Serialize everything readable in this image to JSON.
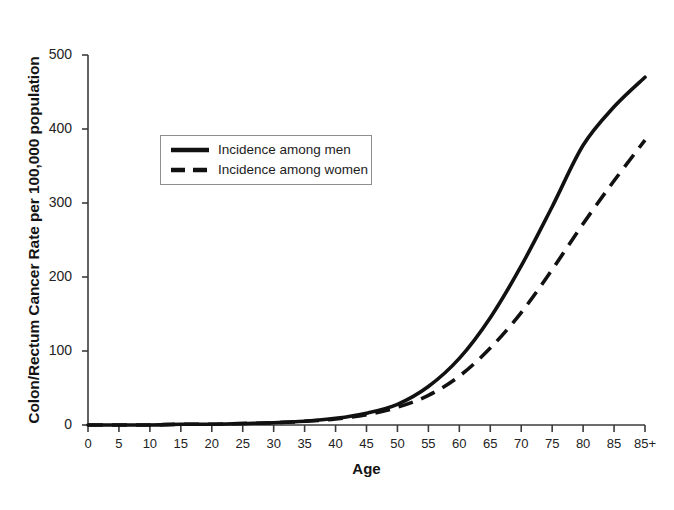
{
  "chart_data": {
    "type": "line",
    "title": "",
    "xlabel": "Age",
    "ylabel": "Colon/Rectum Cancer Rate per 100,000 population",
    "xlim": [
      0,
      90
    ],
    "ylim": [
      0,
      500
    ],
    "grid": false,
    "legend_position": "upper-left-inside",
    "x": [
      0,
      5,
      10,
      15,
      20,
      25,
      30,
      35,
      40,
      45,
      50,
      55,
      60,
      65,
      70,
      75,
      80,
      85,
      90
    ],
    "xtick_labels": [
      "0",
      "5",
      "10",
      "15",
      "20",
      "25",
      "30",
      "35",
      "40",
      "45",
      "50",
      "55",
      "60",
      "65",
      "70",
      "75",
      "80",
      "85",
      "85+"
    ],
    "ytick_labels": [
      "0",
      "100",
      "200",
      "300",
      "400",
      "500"
    ],
    "ytick_values": [
      0,
      100,
      200,
      300,
      400,
      500
    ],
    "series": [
      {
        "name": "Incidence among men",
        "style": "solid",
        "color": "#111111",
        "values": [
          0,
          0,
          0,
          1,
          1,
          2,
          3,
          5,
          9,
          16,
          28,
          52,
          90,
          145,
          215,
          295,
          378,
          430,
          470
        ]
      },
      {
        "name": "Incidence among women",
        "style": "dashed",
        "color": "#111111",
        "values": [
          0,
          0,
          0,
          1,
          1,
          2,
          3,
          5,
          8,
          14,
          24,
          40,
          66,
          104,
          152,
          210,
          272,
          330,
          385
        ]
      }
    ]
  },
  "legend": {
    "items": [
      {
        "label": "Incidence among men",
        "style": "solid"
      },
      {
        "label": "Incidence among women",
        "style": "dashed"
      }
    ]
  },
  "caption": {
    "text": ""
  }
}
